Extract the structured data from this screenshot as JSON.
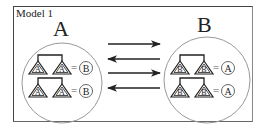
{
  "diagram": {
    "title": "Model 1",
    "left_group": {
      "label": "A",
      "rows": [
        {
          "trees": [
            "A",
            "A"
          ],
          "equals": "=",
          "result": "B"
        },
        {
          "trees": [
            "A",
            "A"
          ],
          "equals": "=",
          "result": "B"
        }
      ]
    },
    "right_group": {
      "label": "B",
      "rows": [
        {
          "trees": [
            "B",
            "B"
          ],
          "equals": "=",
          "result": "A"
        },
        {
          "trees": [
            "B",
            "B"
          ],
          "equals": "=",
          "result": "A"
        }
      ]
    },
    "arrows": [
      {
        "direction": "right"
      },
      {
        "direction": "left"
      },
      {
        "direction": "right"
      },
      {
        "direction": "left"
      }
    ],
    "colors": {
      "line": "#222222",
      "circle": "#999999",
      "background": "#ffffff"
    }
  }
}
